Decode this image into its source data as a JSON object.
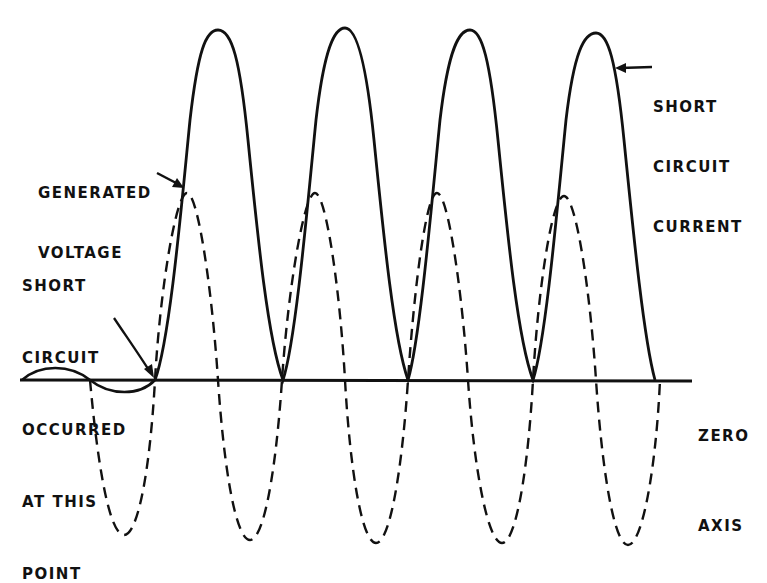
{
  "diagram": {
    "labels": {
      "short_circuit_current": [
        "SHORT",
        "CIRCUIT",
        "CURRENT"
      ],
      "generated_voltage": [
        "GENERATED",
        "VOLTAGE"
      ],
      "short_circuit_point": [
        "SHORT",
        "CIRCUIT",
        "OCCURRED",
        "AT THIS",
        "POINT"
      ],
      "zero_axis": [
        "ZERO",
        "AXIS"
      ]
    },
    "curves": [
      {
        "name": "Generated voltage",
        "style": "dashed",
        "color": "#111111"
      },
      {
        "name": "Short circuit current",
        "style": "solid",
        "color": "#111111"
      }
    ],
    "axis": {
      "name": "Zero axis",
      "y": 380
    }
  }
}
